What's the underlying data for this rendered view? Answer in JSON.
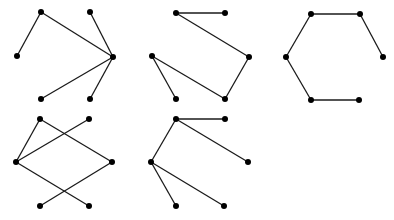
{
  "figure": {
    "node_radius": 3,
    "edge_color": "#1a1a1a",
    "node_color": "#000000",
    "background": "#ffffff"
  },
  "graphs": [
    {
      "id": "graph-1",
      "nodes": {
        "TL": [
          41,
          12
        ],
        "TR": [
          90,
          12
        ],
        "L": [
          17,
          56
        ],
        "R": [
          113,
          57
        ],
        "BL": [
          41,
          99
        ],
        "BR": [
          90,
          99
        ]
      },
      "edges": [
        [
          "TL",
          "L"
        ],
        [
          "TL",
          "R"
        ],
        [
          "TR",
          "R"
        ],
        [
          "R",
          "BL"
        ],
        [
          "R",
          "BR"
        ]
      ]
    },
    {
      "id": "graph-2",
      "nodes": {
        "TL": [
          176,
          13
        ],
        "TR": [
          225,
          13
        ],
        "L": [
          152,
          56
        ],
        "R": [
          249,
          57
        ],
        "BL": [
          176,
          99
        ],
        "BR": [
          225,
          99
        ]
      },
      "edges": [
        [
          "TL",
          "TR"
        ],
        [
          "TL",
          "R"
        ],
        [
          "R",
          "BR"
        ],
        [
          "BR",
          "L"
        ],
        [
          "L",
          "BL"
        ]
      ]
    },
    {
      "id": "graph-3",
      "nodes": {
        "TL": [
          311,
          14
        ],
        "TR": [
          360,
          14
        ],
        "L": [
          286,
          57
        ],
        "R": [
          383,
          57
        ],
        "BL": [
          311,
          100
        ],
        "BR": [
          359,
          100
        ]
      },
      "edges": [
        [
          "TL",
          "TR"
        ],
        [
          "TR",
          "R"
        ],
        [
          "TL",
          "L"
        ],
        [
          "L",
          "BL"
        ],
        [
          "BL",
          "BR"
        ]
      ]
    },
    {
      "id": "graph-4",
      "nodes": {
        "TL": [
          40,
          119
        ],
        "TR": [
          89,
          119
        ],
        "L": [
          16,
          162
        ],
        "R": [
          112,
          162
        ],
        "BL": [
          40,
          206
        ],
        "BR": [
          89,
          206
        ]
      },
      "edges": [
        [
          "TL",
          "L"
        ],
        [
          "TL",
          "R"
        ],
        [
          "TR",
          "L"
        ],
        [
          "L",
          "BR"
        ],
        [
          "R",
          "BL"
        ]
      ]
    },
    {
      "id": "graph-5",
      "nodes": {
        "TL": [
          176,
          119
        ],
        "TR": [
          225,
          119
        ],
        "L": [
          151,
          162
        ],
        "R": [
          248,
          162
        ],
        "BL": [
          176,
          206
        ],
        "BR": [
          224,
          206
        ]
      },
      "edges": [
        [
          "TL",
          "TR"
        ],
        [
          "TL",
          "R"
        ],
        [
          "TL",
          "L"
        ],
        [
          "L",
          "BL"
        ],
        [
          "L",
          "BR"
        ]
      ]
    }
  ]
}
